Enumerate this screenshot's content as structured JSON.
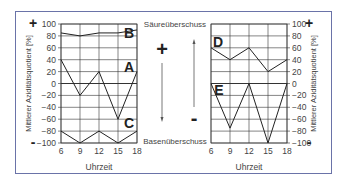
{
  "chart_data": [
    {
      "type": "line",
      "title": "",
      "xlabel": "Uhrzeit",
      "ylabel": "Mittlerer Aziditätsquotient [%]",
      "x": [
        6,
        9,
        12,
        15,
        18
      ],
      "xticks": [
        "6",
        "9",
        "12",
        "15",
        "18"
      ],
      "yticks": [
        "100",
        "80",
        "60",
        "40",
        "20",
        "0",
        "-20",
        "-40",
        "-60",
        "-80",
        "-100"
      ],
      "ylim": [
        -100,
        100
      ],
      "xlim": [
        6,
        18
      ],
      "grid": true,
      "ylabel_position": "left",
      "top_sign": "+",
      "bottom_sign": "-",
      "series": [
        {
          "name": "B",
          "values": [
            85,
            80,
            85,
            85,
            90
          ]
        },
        {
          "name": "A",
          "values": [
            40,
            -20,
            20,
            -60,
            20
          ]
        },
        {
          "name": "C",
          "values": [
            -80,
            -100,
            -80,
            -100,
            -80
          ]
        }
      ]
    },
    {
      "type": "line",
      "title": "",
      "xlabel": "Uhrzeit",
      "ylabel": "Mittlerer Aziditätsquotient [%]",
      "x": [
        6,
        9,
        12,
        15,
        18
      ],
      "xticks": [
        "6",
        "9",
        "12",
        "15",
        "18"
      ],
      "yticks": [
        "100",
        "80",
        "60",
        "40",
        "20",
        "0",
        "-20",
        "-40",
        "-60",
        "-80",
        "-100"
      ],
      "ylim": [
        -100,
        100
      ],
      "xlim": [
        6,
        18
      ],
      "grid": true,
      "ylabel_position": "right",
      "top_sign": "+",
      "bottom_sign": "-",
      "series": [
        {
          "name": "D",
          "values": [
            60,
            40,
            60,
            20,
            40
          ]
        },
        {
          "name": "E",
          "values": [
            0,
            -75,
            0,
            -100,
            0
          ]
        }
      ]
    }
  ],
  "middle": {
    "top_label": "Säureüberschuss",
    "bottom_label": "Basenüberschuss",
    "plus_sign": "+",
    "minus_sign": "-"
  }
}
